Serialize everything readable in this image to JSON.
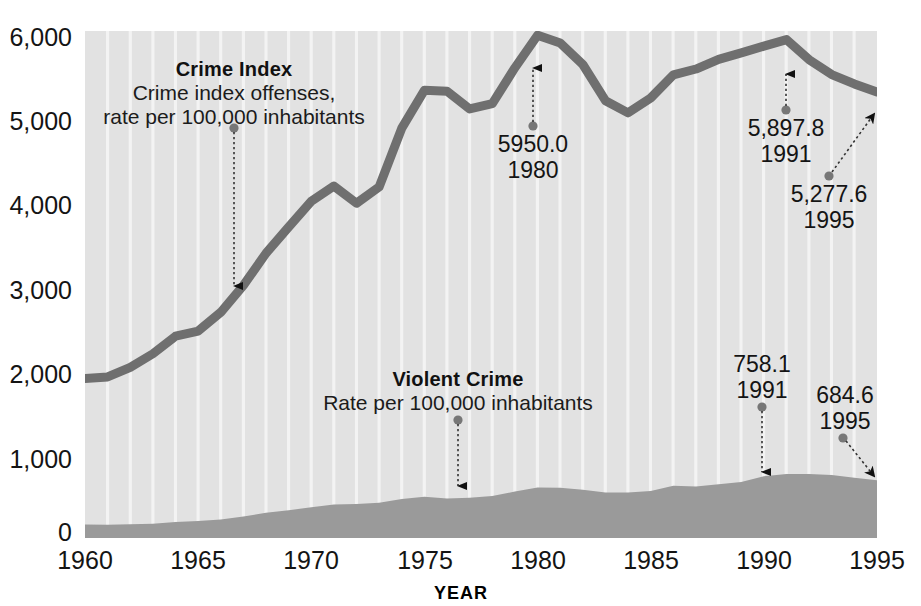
{
  "chart_data": {
    "type": "line",
    "title": "",
    "xlabel": "YEAR",
    "ylabel": "",
    "xlim": [
      1960,
      1995
    ],
    "ylim": [
      0,
      6000
    ],
    "grid": "vertical-white-year-lines",
    "legend_position": "inside-plot",
    "x": [
      1960,
      1961,
      1962,
      1963,
      1964,
      1965,
      1966,
      1967,
      1968,
      1969,
      1970,
      1971,
      1972,
      1973,
      1974,
      1975,
      1976,
      1977,
      1978,
      1979,
      1980,
      1981,
      1982,
      1983,
      1984,
      1985,
      1986,
      1987,
      1988,
      1989,
      1990,
      1991,
      1992,
      1993,
      1994,
      1995
    ],
    "series": [
      {
        "name": "Crime Index",
        "render": "line",
        "color": "#6f6f6f",
        "units": "rate per 100,000 inhabitants",
        "values": [
          1887.2,
          1906.1,
          2019.8,
          2180.3,
          2388.1,
          2449.0,
          2670.8,
          2989.7,
          3370.2,
          3680.0,
          3984.5,
          4164.7,
          3961.4,
          4154.4,
          4850.4,
          5298.5,
          5287.3,
          5077.6,
          5140.3,
          5565.5,
          5950.0,
          5858.2,
          5603.6,
          5175.0,
          5031.3,
          5207.1,
          5480.4,
          5550.0,
          5664.2,
          5741.0,
          5820.3,
          5897.8,
          5660.2,
          5484.4,
          5373.5,
          5277.6
        ]
      },
      {
        "name": "Violent Crime",
        "render": "area",
        "color": "#9a9a9a",
        "units": "Rate per 100,000 inhabitants",
        "values": [
          160.9,
          158.1,
          162.3,
          168.2,
          190.6,
          200.2,
          220.0,
          253.2,
          298.4,
          328.7,
          363.5,
          396.0,
          401.0,
          417.4,
          461.1,
          487.8,
          467.8,
          475.9,
          497.8,
          548.9,
          596.6,
          594.3,
          571.1,
          537.7,
          539.2,
          556.6,
          617.7,
          609.7,
          637.2,
          663.1,
          731.8,
          758.1,
          757.5,
          746.8,
          713.6,
          684.6
        ]
      }
    ],
    "annotations": [
      {
        "id": "crime-index-1980",
        "value": "5950.0",
        "year": "1980",
        "series": "Crime Index"
      },
      {
        "id": "crime-index-1991",
        "value": "5,897.8",
        "year": "1991",
        "series": "Crime Index"
      },
      {
        "id": "crime-index-1995",
        "value": "5,277.6",
        "year": "1995",
        "series": "Crime Index"
      },
      {
        "id": "violent-crime-1991",
        "value": "758.1",
        "year": "1991",
        "series": "Violent Crime"
      },
      {
        "id": "violent-crime-1995",
        "value": "684.6",
        "year": "1995",
        "series": "Violent Crime"
      }
    ]
  },
  "axes": {
    "y_ticks": [
      "6,000",
      "5,000",
      "4,000",
      "3,000",
      "2,000",
      "1,000",
      "0"
    ],
    "x_ticks": [
      "1960",
      "1965",
      "1970",
      "1975",
      "1980",
      "1985",
      "1990",
      "1995"
    ],
    "x_axis_title": "YEAR"
  },
  "legends": {
    "crime_index": {
      "title": "Crime Index",
      "line1": "Crime index offenses,",
      "line2": "rate per 100,000 inhabitants"
    },
    "violent_crime": {
      "title": "Violent Crime",
      "line1": "Rate per 100,000 inhabitants"
    }
  },
  "callouts": {
    "ci_1980": {
      "value": "5950.0",
      "year": "1980"
    },
    "ci_1991": {
      "value": "5,897.8",
      "year": "1991"
    },
    "ci_1995": {
      "value": "5,277.6",
      "year": "1995"
    },
    "vc_1991": {
      "value": "758.1",
      "year": "1991"
    },
    "vc_1995": {
      "value": "684.6",
      "year": "1995"
    }
  },
  "colors": {
    "plot_background": "#e2e2e2",
    "crime_index_line": "#6f6f6f",
    "violent_crime_area": "#9a9a9a",
    "gridline": "#f2f2f2",
    "text": "#141414"
  }
}
